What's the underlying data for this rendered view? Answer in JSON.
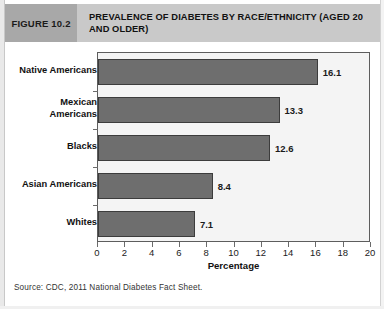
{
  "figure": {
    "number_label": "FIGURE 10.2",
    "title": "PREVALENCE OF DIABETES BY RACE/ETHNICITY (AGED 20 AND OLDER)",
    "source_note": "Source: CDC, 2011 National Diabetes Fact Sheet."
  },
  "colors": {
    "header_band": "#c9c9c9",
    "figure_number_box": "#a8a8a8",
    "bar_fill": "#6e6e6e",
    "bar_border": "#3c3c3c",
    "plot_background": "#f4f4f4",
    "plot_border": "#5d5d5d",
    "text": "#111111"
  },
  "chart_data": {
    "type": "bar",
    "orientation": "horizontal",
    "title": "PREVALENCE OF DIABETES BY RACE/ETHNICITY (AGED 20 AND OLDER)",
    "categories": [
      "Native Americans",
      "Mexican\nAmericans",
      "Blacks",
      "Asian Americans",
      "Whites"
    ],
    "values": [
      16.1,
      13.3,
      12.6,
      8.4,
      7.1
    ],
    "value_labels": [
      "16.1",
      "13.3",
      "12.6",
      "8.4",
      "7.1"
    ],
    "xlabel": "Percentage",
    "ylabel": "",
    "xlim": [
      0,
      20
    ],
    "xticks": [
      0,
      2,
      4,
      6,
      8,
      10,
      12,
      14,
      16,
      18,
      20
    ],
    "xtick_labels": [
      "0",
      "2",
      "4",
      "6",
      "8",
      "10",
      "12",
      "14",
      "16",
      "18",
      "20"
    ],
    "grid": false,
    "legend": false
  }
}
